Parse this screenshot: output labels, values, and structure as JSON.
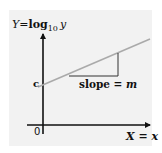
{
  "diagram": {
    "y_axis_label": {
      "lhs": "Y",
      "eq": "=",
      "fn": "log",
      "sub": "10",
      "var": "y"
    },
    "x_axis_label": {
      "lhs": "X",
      "eq": " = ",
      "var": "x"
    },
    "origin_label": "0",
    "intercept_label": "c",
    "slope_label": {
      "text": "slope = ",
      "var": "m"
    },
    "colors": {
      "panel": "#f2f2f2",
      "axes": "#111111",
      "line": "#aaaaaa",
      "triangle": "#333333"
    }
  }
}
